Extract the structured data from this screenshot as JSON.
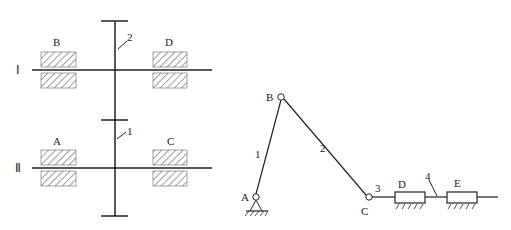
{
  "left_figure": {
    "shafts": [
      {
        "id": "I",
        "label": "Ⅰ",
        "y": 70,
        "gear_label": "2",
        "bearings": [
          "B",
          "D"
        ]
      },
      {
        "id": "II",
        "label": "Ⅱ",
        "y": 168,
        "gear_label": "1",
        "bearings": [
          "A",
          "C"
        ]
      }
    ],
    "bearing_labels": {
      "B": "B",
      "D": "D",
      "A": "A",
      "C": "C"
    },
    "gear_labels": {
      "upper": "2",
      "lower": "1"
    },
    "shaft_labels": {
      "upper": "Ⅰ",
      "lower": "Ⅱ"
    }
  },
  "right_figure": {
    "joints": {
      "A": "A",
      "B": "B",
      "C": "C"
    },
    "links": {
      "crank": "1",
      "coupler": "2",
      "pin": "3",
      "rod": "4"
    },
    "sliders": {
      "D": "D",
      "E": "E"
    }
  },
  "colors": {
    "line": "#222222",
    "background": "#ffffff"
  }
}
